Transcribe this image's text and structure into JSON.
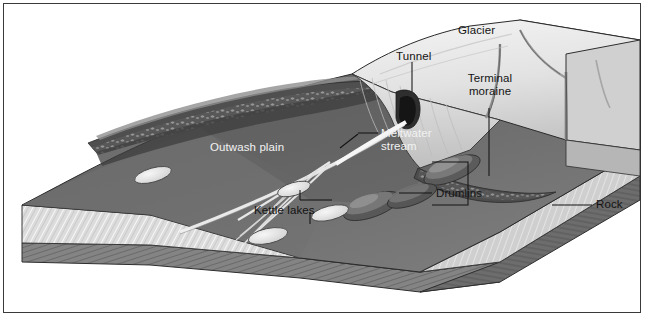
{
  "figure": {
    "style": "grayscale pen-and-ink geological block diagram",
    "border_color": "#3a3a3a",
    "background_color": "#ffffff"
  },
  "labels": {
    "glacier": "Glacier",
    "tunnel": "Tunnel",
    "terminal_moraine": "Terminal\nmoraine",
    "terminal_moraine_line1": "Terminal",
    "terminal_moraine_line2": "moraine",
    "outwash_plain": "Outwash plain",
    "meltwater_stream_line1": "Meltwater",
    "meltwater_stream_line2": "stream",
    "drumlins": "Drumlins",
    "kettle_lakes": "Kettle lakes",
    "rock": "Rock"
  },
  "palette": {
    "ice_light": "#ececec",
    "ice_mid": "#d3d3d3",
    "ice_shadow": "#b4b4b4",
    "plain_dark": "#5e5e5e",
    "plain_mid": "#6e6e6e",
    "moraine_cobble": "#4a4a4a",
    "sediment_hatch": "#d8d8d8",
    "bedrock": "#7b7b7b",
    "bedrock_dark": "#565656",
    "water": "#e8e8e8",
    "outline": "#2c2c2c",
    "leader_line": "#1a1a1a"
  },
  "features": [
    {
      "name": "glacier",
      "type": "ice-mass",
      "position": "right",
      "detail": "crevassed ice sheet with fractures"
    },
    {
      "name": "terminal-moraine",
      "type": "ridge",
      "position": "glacier-front",
      "detail": "debris ridge at ice margin"
    },
    {
      "name": "recessional-moraine",
      "type": "ridge",
      "position": "center-left",
      "detail": "cobble-strewn arcuate ridge"
    },
    {
      "name": "outwash-plain",
      "type": "plain",
      "position": "left-center",
      "detail": "braided sandur surface"
    },
    {
      "name": "meltwater-stream",
      "type": "channel",
      "position": "center",
      "detail": "braided channels from tunnel mouth"
    },
    {
      "name": "tunnel",
      "type": "ice-cave",
      "position": "glacier-base",
      "detail": "subglacial tunnel portal"
    },
    {
      "name": "kettle-lakes",
      "type": "lake",
      "count": 4,
      "detail": "elliptical depressions holding water"
    },
    {
      "name": "drumlins",
      "type": "hill",
      "count": 3,
      "detail": "streamlined till mounds"
    },
    {
      "name": "rock",
      "type": "substrate",
      "position": "block-base",
      "detail": "layered bedrock beneath sediment"
    }
  ]
}
